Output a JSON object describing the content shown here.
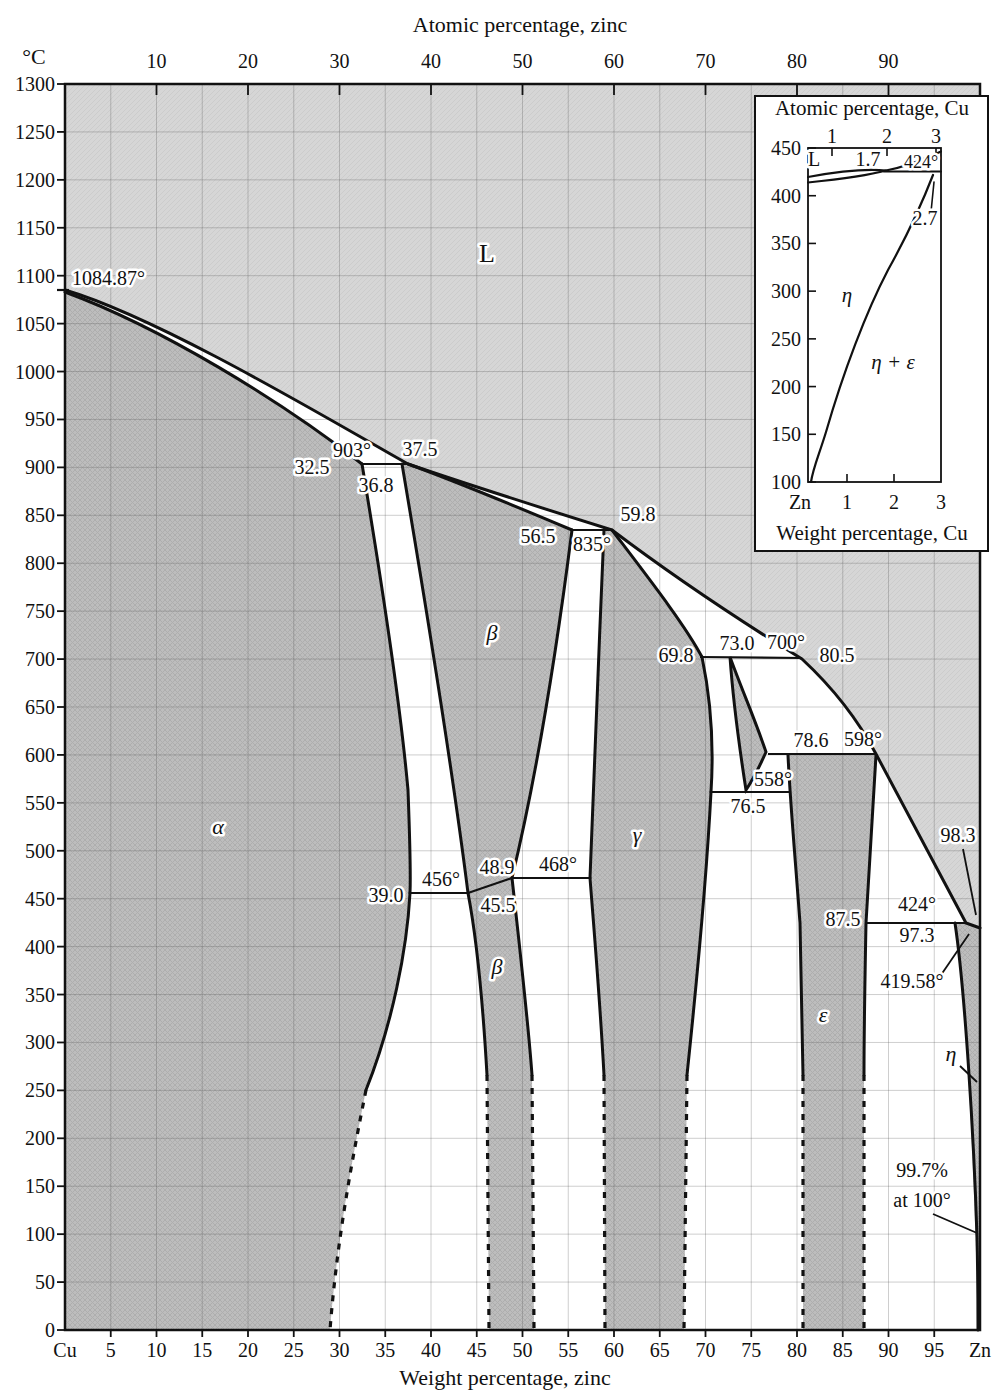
{
  "figure": {
    "top_axis_title": "Atomic percentage, zinc",
    "left_axis_title": "°C",
    "bottom_axis_title": "Weight percentage, zinc"
  },
  "axes": {
    "left_ticks": [
      "1300",
      "1250",
      "1200",
      "1150",
      "1100",
      "1050",
      "1000",
      "950",
      "900",
      "850",
      "800",
      "750",
      "700",
      "650",
      "600",
      "550",
      "500",
      "450",
      "400",
      "350",
      "300",
      "250",
      "200",
      "150",
      "100",
      "50",
      "0"
    ],
    "bottom_ticks": [
      "Cu",
      "5",
      "10",
      "15",
      "20",
      "25",
      "30",
      "35",
      "40",
      "45",
      "50",
      "55",
      "60",
      "65",
      "70",
      "75",
      "80",
      "85",
      "90",
      "95",
      "Zn"
    ],
    "top_ticks": [
      "10",
      "20",
      "30",
      "40",
      "50",
      "60",
      "70",
      "80",
      "90"
    ]
  },
  "inset": {
    "top_axis_title": "Atomic percentage, Cu",
    "bottom_axis_title": "Weight percentage, Cu",
    "left_ticks": [
      "450",
      "400",
      "350",
      "300",
      "250",
      "200",
      "150",
      "100"
    ],
    "bottom_ticks": [
      "Zn",
      "1",
      "2",
      "3"
    ],
    "top_ticks": [
      "1",
      "2",
      "3"
    ],
    "annotations": [
      {
        "text": "L",
        "x": 814,
        "y": 166
      },
      {
        "text": "1.7",
        "x": 868,
        "y": 166
      },
      {
        "text": "424°",
        "x": 921,
        "y": 168,
        "size": 18
      },
      {
        "text": "2.7",
        "x": 925,
        "y": 225
      },
      {
        "text": "η",
        "x": 847,
        "y": 302,
        "italic": true,
        "size": 21
      },
      {
        "text": "η + ε",
        "x": 893,
        "y": 369,
        "italic": true,
        "size": 21
      }
    ]
  },
  "annotations": [
    {
      "text": "1084.87°",
      "x": 72,
      "y": 285,
      "anchor": "start"
    },
    {
      "text": "L",
      "x": 487,
      "y": 262,
      "size": 26
    },
    {
      "text": "32.5",
      "x": 312,
      "y": 474
    },
    {
      "text": "903°",
      "x": 352,
      "y": 457
    },
    {
      "text": "37.5",
      "x": 420,
      "y": 456
    },
    {
      "text": "36.8",
      "x": 376,
      "y": 492
    },
    {
      "text": "56.5",
      "x": 538,
      "y": 543
    },
    {
      "text": "835°",
      "x": 592,
      "y": 551
    },
    {
      "text": "59.8",
      "x": 638,
      "y": 521
    },
    {
      "text": "69.8",
      "x": 676,
      "y": 662
    },
    {
      "text": "73.0",
      "x": 737,
      "y": 650
    },
    {
      "text": "700°",
      "x": 786,
      "y": 649
    },
    {
      "text": "80.5",
      "x": 837,
      "y": 662
    },
    {
      "text": "78.6",
      "x": 811,
      "y": 747
    },
    {
      "text": "598°",
      "x": 863,
      "y": 746
    },
    {
      "text": "558°",
      "x": 773,
      "y": 786
    },
    {
      "text": "76.5",
      "x": 748,
      "y": 813
    },
    {
      "text": "39.0",
      "x": 386,
      "y": 902
    },
    {
      "text": "456°",
      "x": 441,
      "y": 886
    },
    {
      "text": "48.9",
      "x": 497,
      "y": 874
    },
    {
      "text": "468°",
      "x": 558,
      "y": 871
    },
    {
      "text": "45.5",
      "x": 498,
      "y": 912
    },
    {
      "text": "87.5",
      "x": 843,
      "y": 926
    },
    {
      "text": "424°",
      "x": 917,
      "y": 911
    },
    {
      "text": "97.3",
      "x": 917,
      "y": 942
    },
    {
      "text": "419.58°",
      "x": 912,
      "y": 988
    },
    {
      "text": "98.3",
      "x": 958,
      "y": 842
    },
    {
      "text": "99.7%",
      "x": 922,
      "y": 1177
    },
    {
      "text": "at 100°",
      "x": 922,
      "y": 1207
    },
    {
      "text": "α",
      "x": 218,
      "y": 834,
      "italic": true,
      "size": 22
    },
    {
      "text": "β",
      "x": 492,
      "y": 640,
      "italic": true,
      "size": 22
    },
    {
      "text": "γ",
      "x": 637,
      "y": 842,
      "italic": true,
      "size": 22
    },
    {
      "text": "β",
      "x": 497,
      "y": 974,
      "italic": true,
      "size": 22
    },
    {
      "text": "ε",
      "x": 823,
      "y": 1022,
      "italic": true,
      "size": 22
    },
    {
      "text": "η",
      "x": 951,
      "y": 1061,
      "italic": true,
      "size": 22
    }
  ],
  "colors": {
    "liquid_region": "#d6d6d6",
    "solid_region": "#bdbdbd",
    "two_phase_region": "#ffffff",
    "line": "#111111",
    "grid": "rgba(80,80,80,0.28)"
  },
  "chart_data": {
    "type": "phase-diagram",
    "system": "Cu-Zn",
    "x_axis": {
      "label_bottom": "Weight percentage, zinc",
      "label_top": "Atomic percentage, zinc",
      "range_wt_pct": [
        0,
        100
      ]
    },
    "y_axis": {
      "label": "°C",
      "range_C": [
        0,
        1300
      ],
      "tick_step_C": 50
    },
    "phases": [
      "L",
      "α",
      "β",
      "β(ordered)",
      "γ",
      "δ",
      "ε",
      "η"
    ],
    "special_points": {
      "Cu_melting_C": 1084.87,
      "Zn_melting_C": 419.58,
      "eta_solubility_note": "99.7% at 100°"
    },
    "invariant_lines": [
      {
        "temp_C": 903,
        "compositions_wt_Zn": [
          32.5,
          36.8,
          37.5
        ]
      },
      {
        "temp_C": 835,
        "compositions_wt_Zn": [
          56.5,
          59.8
        ]
      },
      {
        "temp_C": 700,
        "compositions_wt_Zn": [
          69.8,
          73.0,
          80.5
        ]
      },
      {
        "temp_C": 598,
        "compositions_wt_Zn": [
          78.6
        ]
      },
      {
        "temp_C": 558,
        "compositions_wt_Zn": [
          76.5
        ]
      },
      {
        "temp_C": 468,
        "compositions_wt_Zn": [
          48.9
        ]
      },
      {
        "temp_C": 456,
        "compositions_wt_Zn": [
          39.0,
          45.5
        ]
      },
      {
        "temp_C": 424,
        "compositions_wt_Zn": [
          87.5,
          97.3,
          98.3
        ]
      }
    ],
    "liquidus_wt_Zn_vs_C": [
      [
        0,
        1084.87
      ],
      [
        37.5,
        903
      ],
      [
        59.8,
        835
      ],
      [
        80.5,
        700
      ],
      [
        88.6,
        598
      ],
      [
        98.3,
        424
      ],
      [
        100,
        419.58
      ]
    ],
    "inset": {
      "x_axis": {
        "label_bottom": "Weight percentage, Cu",
        "label_top": "Atomic percentage, Cu",
        "range_wt_Cu": [
          0,
          3
        ]
      },
      "y_axis": {
        "range_C": [
          100,
          450
        ]
      },
      "eutectic_C": 424,
      "liquid_Cu_wt_pct": 1.7,
      "eta_boundary_Cu_wt_pct": 2.7,
      "regions": [
        "L",
        "η",
        "η + ε"
      ]
    }
  }
}
